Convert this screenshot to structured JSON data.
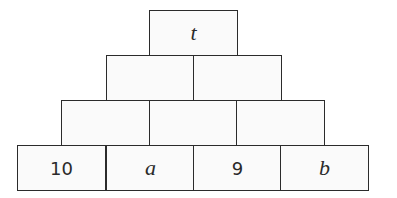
{
  "pyramid": {
    "rows": [
      {
        "cells": [
          {
            "value": "t",
            "kind": "var"
          }
        ]
      },
      {
        "cells": [
          {
            "value": "",
            "kind": "empty"
          },
          {
            "value": "",
            "kind": "empty"
          }
        ]
      },
      {
        "cells": [
          {
            "value": "",
            "kind": "empty"
          },
          {
            "value": "",
            "kind": "empty"
          },
          {
            "value": "",
            "kind": "empty"
          }
        ]
      },
      {
        "cells": [
          {
            "value": "10",
            "kind": "num"
          },
          {
            "value": "a",
            "kind": "var"
          },
          {
            "value": "9",
            "kind": "num"
          },
          {
            "value": "b",
            "kind": "var"
          }
        ]
      }
    ]
  },
  "colors": {
    "border": "#2b2b2b",
    "cell_bg": "#fafafa",
    "text": "#2a2a2a"
  }
}
